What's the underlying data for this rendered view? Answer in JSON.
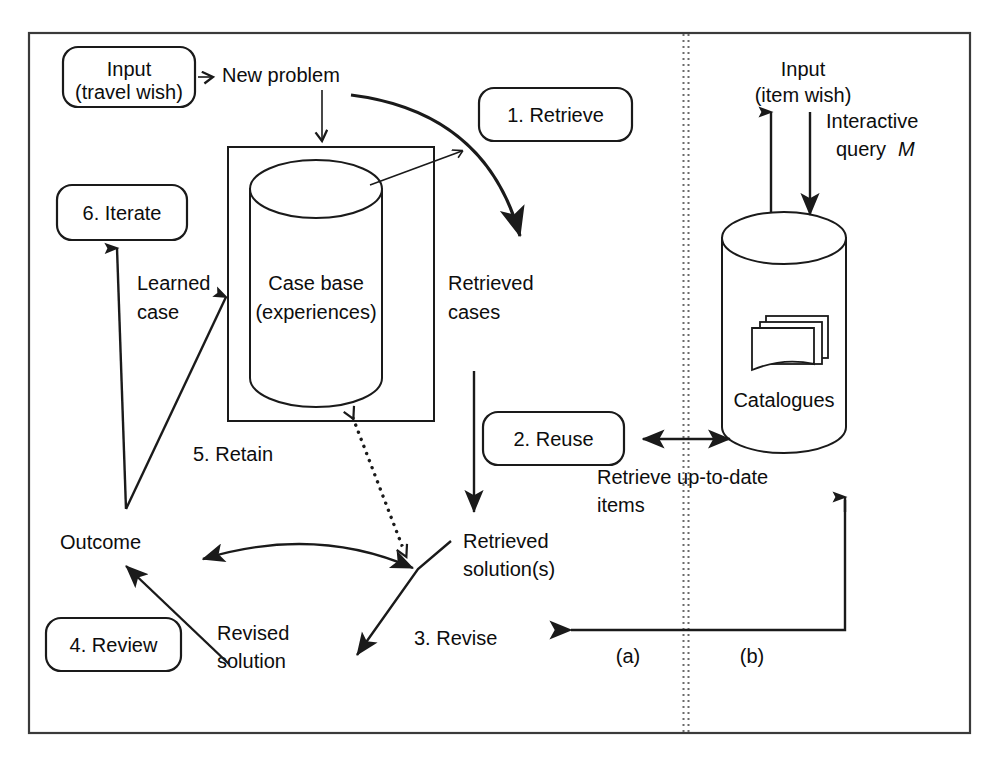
{
  "figure": {
    "frame_color": "#3a3a3a",
    "line_color": "#1a1a1a",
    "background": "#ffffff"
  },
  "boxes": {
    "input_travel": "Input\n(travel wish)",
    "input_travel_line1": "Input",
    "input_travel_line2": "(travel wish)",
    "step1": "1. Retrieve",
    "step2": "2. Reuse",
    "step3": "3. Revise",
    "step4": "4. Review",
    "step5": "5. Retain",
    "step6": "6. Iterate"
  },
  "labels": {
    "new_problem": "New problem",
    "case_base_line1": "Case base",
    "case_base_line2": "(experiences)",
    "retrieved_cases_line1": "Retrieved",
    "retrieved_cases_line2": "cases",
    "learned_case_line1": "Learned",
    "learned_case_line2": "case",
    "outcome": "Outcome",
    "retrieved_solution_line1": "Retrieved",
    "retrieved_solution_line2": "solution(s)",
    "revised_solution_line1": "Revised",
    "revised_solution_line2": "solution",
    "retrieve_uptodate_line1": "Retrieve up-to-date",
    "retrieve_uptodate_line2": "items",
    "input_item_line1": "Input",
    "input_item_line2": "(item wish)",
    "interactive_query_line1": "Interactive",
    "interactive_query_line2_prefix": "query ",
    "interactive_query_line2_var": "M",
    "catalogues": "Catalogues",
    "path_a": "(a)",
    "path_b": "(b)"
  },
  "icons": {
    "case_base": "cylinder-database-icon",
    "catalogues": "cylinder-database-icon",
    "catalogue_cards": "stacked-documents-icon",
    "divider": "vertical-dotted-divider"
  }
}
